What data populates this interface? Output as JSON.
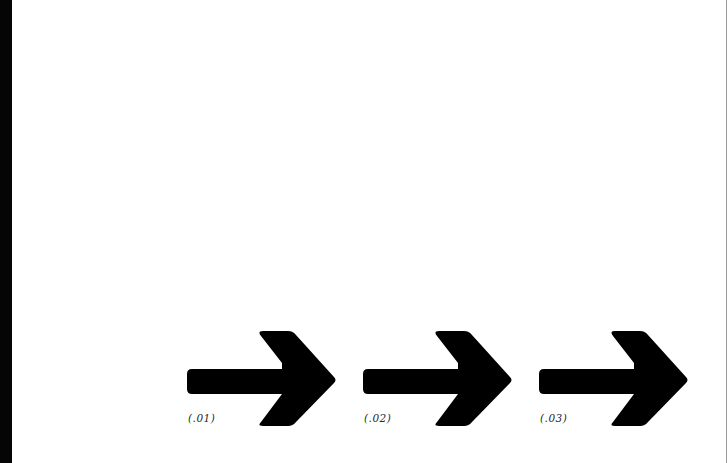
{
  "colors": {
    "background": "#ffffff",
    "left_bar": "#050505",
    "arrow_fill": "#000000",
    "label_text": "#2a2a2a",
    "right_edge": "#9a9a9a"
  },
  "arrows": [
    {
      "icon": "arrow-right-icon",
      "label": "(.01)"
    },
    {
      "icon": "arrow-right-icon",
      "label": "(.02)"
    },
    {
      "icon": "arrow-right-icon",
      "label": "(.03)"
    }
  ]
}
